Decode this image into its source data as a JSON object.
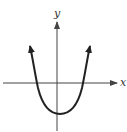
{
  "figure": {
    "type": "parabola-graph",
    "equation_form": "y = a(x - h)^2 + k, a > 0, k < 0",
    "axes": {
      "x_label": "x",
      "y_label": "y"
    },
    "curve": {
      "shape": "upward-opening parabola",
      "vertex_position": "below x-axis, slightly right of y-axis",
      "x_intercepts": 2,
      "end_arrows": true
    },
    "colors": {
      "curve": "#222222",
      "axes": "#444444",
      "background": "#ffffff"
    }
  }
}
